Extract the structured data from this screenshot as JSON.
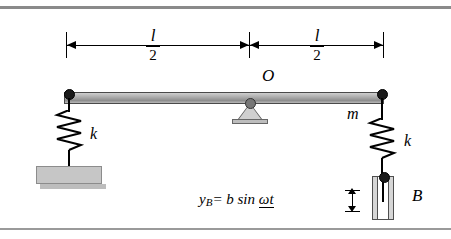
{
  "figure": {
    "dimensions": {
      "left": {
        "numerator": "l",
        "denominator": "2"
      },
      "right": {
        "numerator": "l",
        "denominator": "2"
      }
    },
    "labels": {
      "pivot": "O",
      "mass": "m",
      "spring_left": "k",
      "spring_right": "k",
      "base_point": "B",
      "excitation_equation_lhs": "y",
      "excitation_equation_sub": "B",
      "excitation_equation_rhs": "= b sin ",
      "excitation_equation_arg": "ωt"
    },
    "colors": {
      "rule": "#8a8a8a",
      "beam_fill": "#a9a9a9",
      "beam_outline": "#4a4a4a",
      "ground_fill": "#c6c6c6",
      "ink": "#000000"
    }
  }
}
